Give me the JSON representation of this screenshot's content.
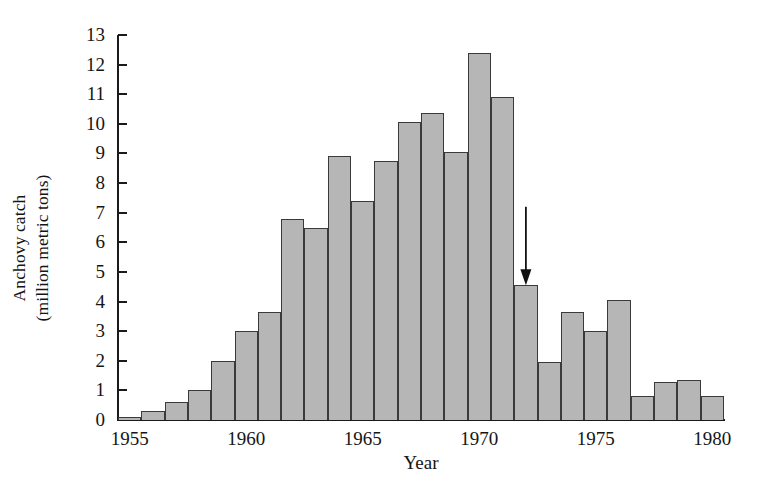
{
  "chart_data": {
    "type": "bar",
    "title": "",
    "xlabel": "Year",
    "ylabel": "Anchovy catch\n(million metric tons)",
    "ylabel_line1": "Anchovy catch",
    "ylabel_line2": "(million metric tons)",
    "categories": [
      1955,
      1956,
      1957,
      1958,
      1959,
      1960,
      1961,
      1962,
      1963,
      1964,
      1965,
      1966,
      1967,
      1968,
      1969,
      1970,
      1971,
      1972,
      1973,
      1974,
      1975,
      1976,
      1977,
      1978,
      1979,
      1980
    ],
    "values": [
      0.1,
      0.3,
      0.6,
      1.0,
      2.0,
      3.0,
      3.65,
      6.8,
      6.5,
      8.9,
      7.4,
      8.75,
      10.05,
      10.35,
      9.05,
      12.4,
      10.9,
      4.55,
      1.95,
      3.65,
      3.0,
      4.05,
      0.8,
      1.3,
      1.35,
      0.8
    ],
    "xlim": [
      1955,
      1981
    ],
    "ylim": [
      0,
      13
    ],
    "yticks": [
      0,
      1,
      2,
      3,
      4,
      5,
      6,
      7,
      8,
      9,
      10,
      11,
      12,
      13
    ],
    "ytick_labels": [
      "0",
      "1",
      "2",
      "3",
      "4",
      "5",
      "6",
      "7",
      "8",
      "9",
      "10",
      "11",
      "12",
      "13"
    ],
    "xticks": [
      1955,
      1960,
      1965,
      1970,
      1975,
      1980
    ],
    "xtick_labels": [
      "1955",
      "1960",
      "1965",
      "1970",
      "1975",
      "1980"
    ],
    "grid": false,
    "legend": false,
    "bar_fill_color": "#b6b6b6",
    "bar_edge_color": "#3a3a3a",
    "axis_color": "#1a1a1a",
    "background_color": "#ffffff",
    "annotations": [
      {
        "name": "collapse-arrow",
        "type": "arrow",
        "points_to_year": 1972,
        "points_to_value": 4.55,
        "tail_value": 7.2,
        "direction": "down",
        "color": "#111111",
        "label": ""
      }
    ]
  }
}
